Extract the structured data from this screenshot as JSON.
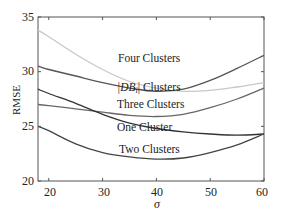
{
  "chart_data": {
    "type": "line",
    "title": "",
    "xlabel": "σ",
    "ylabel": "RMSE",
    "xlim": [
      18,
      60
    ],
    "ylim": [
      20,
      35
    ],
    "xticks": [
      20,
      30,
      40,
      50,
      60
    ],
    "yticks": [
      20,
      25,
      30,
      35
    ],
    "grid": false,
    "legend": "inline labels",
    "x": [
      18,
      20,
      25,
      30,
      35,
      40,
      45,
      50,
      55,
      60
    ],
    "series": [
      {
        "name": "Four Clusters",
        "color": "#c8c8c8",
        "values": [
          33.8,
          33.2,
          31.6,
          30.2,
          29.1,
          28.5,
          28.2,
          28.3,
          28.6,
          29.0
        ]
      },
      {
        "name": "|DB_i| Clusters",
        "color": "#555555",
        "values": [
          30.5,
          30.2,
          29.6,
          29.0,
          28.5,
          28.2,
          28.4,
          29.2,
          30.3,
          31.5
        ]
      },
      {
        "name": "Three Clusters",
        "color": "#666666",
        "values": [
          27.0,
          26.9,
          26.6,
          26.3,
          26.0,
          25.9,
          26.1,
          26.7,
          27.5,
          28.5
        ]
      },
      {
        "name": "One Cluster",
        "color": "#333333",
        "values": [
          28.4,
          28.0,
          27.1,
          26.1,
          25.3,
          24.8,
          24.5,
          24.3,
          24.2,
          24.3
        ]
      },
      {
        "name": "Two Clusters",
        "color": "#444444",
        "values": [
          25.0,
          24.6,
          23.4,
          22.6,
          22.2,
          22.0,
          22.1,
          22.6,
          23.3,
          24.3
        ]
      }
    ],
    "annotations": [
      {
        "text": "Four Clusters",
        "x": 33,
        "y": 31.2
      },
      {
        "text": "|DB_i| Clusters",
        "x": 33,
        "y": 28.3
      },
      {
        "text": "Three Clusters",
        "x": 33,
        "y": 26.9
      },
      {
        "text": "One Cluster",
        "x": 33,
        "y": 24.6
      },
      {
        "text": "Two Clusters",
        "x": 33,
        "y": 22.6
      }
    ]
  },
  "labels": {
    "xlabel": "σ",
    "ylabel": "RMSE",
    "xticks": [
      "20",
      "30",
      "40",
      "50",
      "60"
    ],
    "yticks": [
      "20",
      "25",
      "30",
      "35"
    ],
    "four": "Four Clusters",
    "db_prefix": "|DB",
    "db_sub": "i",
    "db_suffix": "| Clusters",
    "three": "Three Clusters",
    "one": "One Cluster",
    "two": "Two Clusters"
  }
}
